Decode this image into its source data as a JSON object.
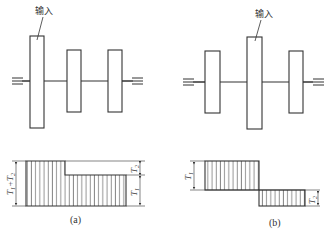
{
  "diagram": {
    "panels": [
      {
        "id": "a",
        "caption": "(a)",
        "input_label": "输入",
        "gears": [
          {
            "role": "input",
            "x": 30,
            "y": 36,
            "w": 14,
            "h": 92
          },
          {
            "role": "output",
            "x": 67,
            "y": 50,
            "w": 14,
            "h": 62
          },
          {
            "role": "output",
            "x": 108,
            "y": 50,
            "w": 14,
            "h": 62
          }
        ],
        "torque_labels": {
          "total": "T1+T2",
          "t1": "T1",
          "t2": "T2"
        }
      },
      {
        "id": "b",
        "caption": "(b)",
        "input_label": "输入",
        "gears": [
          {
            "role": "output",
            "x": 205,
            "y": 51,
            "w": 15,
            "h": 62
          },
          {
            "role": "input",
            "x": 247,
            "y": 37,
            "w": 15,
            "h": 92
          },
          {
            "role": "output",
            "x": 289,
            "y": 51,
            "w": 14,
            "h": 62
          }
        ],
        "torque_labels": {
          "t1": "T1",
          "t2": "T2"
        }
      }
    ],
    "colors": {
      "stroke": "#333333",
      "hatch": "#555555",
      "background": "#ffffff"
    }
  }
}
